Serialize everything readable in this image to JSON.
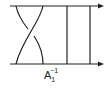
{
  "diagram": {
    "type": "braid-diagram",
    "label": {
      "base": "A",
      "subscript": "1",
      "superscript": "−1"
    },
    "strands": 4,
    "crossing": {
      "between_strands": [
        1,
        2
      ],
      "over_strand": "top-right to bottom-left"
    },
    "colors": {
      "stroke": "#222222",
      "background": "#ffffff"
    }
  }
}
